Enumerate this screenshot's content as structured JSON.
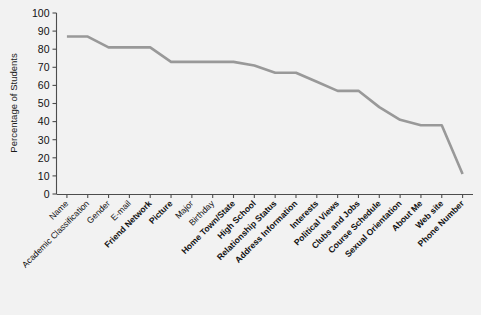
{
  "chart_data": {
    "type": "line",
    "title": "",
    "xlabel": "",
    "ylabel": "Percentage of Students",
    "ylim": [
      0,
      100
    ],
    "ytick_step": 10,
    "yticks": [
      0,
      10,
      20,
      30,
      40,
      50,
      60,
      70,
      80,
      90,
      100
    ],
    "grid": false,
    "legend": "none",
    "line_color": "#999999",
    "categories": [
      "Name",
      "Academic Classification",
      "Gender",
      "E-mail",
      "Friend Network",
      "Picture",
      "Major",
      "Birthday",
      "Home Town/State",
      "High School",
      "Relationship Status",
      "Address Information",
      "Interests",
      "Political Views",
      "Clubs and Jobs",
      "Course Schedule",
      "Sexual Orientation",
      "About Me",
      "Web site",
      "Phone Number"
    ],
    "category_bold": [
      false,
      false,
      false,
      false,
      true,
      true,
      false,
      false,
      true,
      true,
      true,
      true,
      true,
      true,
      true,
      true,
      true,
      true,
      true,
      true
    ],
    "values": [
      87,
      87,
      81,
      81,
      81,
      73,
      73,
      73,
      73,
      71,
      67,
      67,
      62,
      57,
      57,
      48,
      41,
      38,
      38,
      11
    ],
    "series": [
      {
        "name": "Percentage of Students",
        "values": [
          87,
          87,
          81,
          81,
          81,
          73,
          73,
          73,
          73,
          71,
          67,
          67,
          62,
          57,
          57,
          48,
          41,
          38,
          38,
          11
        ]
      }
    ]
  }
}
